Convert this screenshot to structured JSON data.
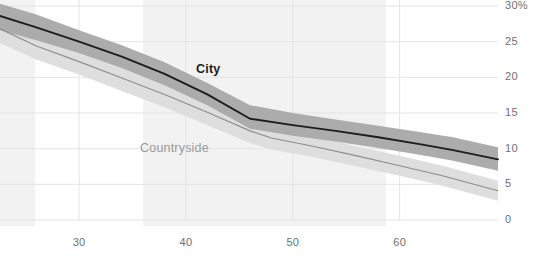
{
  "chart_data": {
    "type": "line",
    "title": "",
    "subtitle": "",
    "xlabel": "",
    "ylabel": "",
    "xlim": [
      22.6,
      69.2
    ],
    "ylim": [
      0,
      30
    ],
    "grid": true,
    "grid_axis": "both",
    "legend_position": "inline-annotations",
    "y_unit": "%",
    "y_ticks": [
      {
        "value": 30,
        "label": "30%"
      },
      {
        "value": 25,
        "label": "25"
      },
      {
        "value": 20,
        "label": "20"
      },
      {
        "value": 15,
        "label": "15"
      },
      {
        "value": 10,
        "label": "10"
      },
      {
        "value": 5,
        "label": "5"
      },
      {
        "value": 0,
        "label": "0"
      }
    ],
    "x_ticks": [
      {
        "value": 30,
        "label": "30"
      },
      {
        "value": 40,
        "label": "40"
      },
      {
        "value": 50,
        "label": "50"
      },
      {
        "value": 60,
        "label": "60"
      }
    ],
    "shaded_x_regions": [
      {
        "x0": 22.6,
        "x1": 25.9,
        "color": "#f2f2f2"
      },
      {
        "x0": 36.0,
        "x1": 58.7,
        "color": "#f2f2f2"
      }
    ],
    "series": [
      {
        "name": "City",
        "label": "City",
        "color": "#1d1d1d",
        "band_color": "#a8a8a8",
        "x": [
          22.6,
          26.0,
          30.0,
          34.0,
          38.0,
          42.0,
          46.0,
          50.0,
          54.0,
          58.0,
          62.0,
          65.0,
          69.2
        ],
        "values": [
          28.6,
          27.0,
          25.0,
          22.9,
          20.5,
          17.6,
          14.2,
          13.3,
          12.5,
          11.6,
          10.6,
          9.8,
          8.5
        ],
        "band_upper": [
          30.3,
          28.8,
          26.6,
          24.5,
          22.1,
          19.2,
          16.1,
          15.0,
          14.1,
          13.2,
          12.3,
          11.6,
          10.2
        ],
        "band_lower": [
          26.6,
          25.2,
          23.4,
          21.3,
          18.9,
          16.1,
          12.8,
          11.8,
          11.0,
          10.1,
          9.1,
          8.3,
          6.9
        ]
      },
      {
        "name": "Countryside",
        "label": "Countryside",
        "color": "#8e8e8e",
        "band_color": "#dcdcdc",
        "x": [
          22.6,
          26.0,
          30.0,
          34.0,
          38.0,
          42.0,
          46.0,
          48.0,
          52.0,
          56.0,
          60.0,
          64.0,
          69.2
        ],
        "values": [
          26.8,
          24.4,
          22.2,
          19.9,
          17.6,
          15.1,
          12.5,
          11.5,
          10.3,
          9.0,
          7.6,
          6.2,
          4.1
        ],
        "band_upper": [
          28.5,
          26.2,
          24.0,
          21.8,
          19.4,
          16.8,
          14.1,
          13.0,
          11.7,
          10.3,
          9.0,
          7.6,
          5.5
        ],
        "band_lower": [
          24.8,
          22.5,
          20.4,
          18.1,
          15.8,
          13.3,
          10.8,
          9.9,
          8.8,
          7.5,
          6.2,
          4.8,
          2.7
        ]
      }
    ],
    "annotations": [
      {
        "text": "City",
        "x_px": 196,
        "y_px": 62
      },
      {
        "text": "Countryside",
        "x_px": 140,
        "y_px": 141
      }
    ]
  },
  "colors": {
    "background": "#ffffff",
    "gridline": "#e4e4e4",
    "tick_text": "#6f6f6f",
    "city_line": "#1d1d1d",
    "city_band": "#a8a8a8",
    "countryside_line": "#8e8e8e",
    "countryside_band": "#dcdcdc",
    "region_shade": "#f2f2f2"
  }
}
